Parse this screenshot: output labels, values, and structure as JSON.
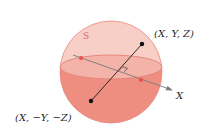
{
  "diagram": {
    "sphere_label": "S",
    "point_upper_label": "(X, Y, Z)",
    "point_lower_label": "(X, −Y, −Z)",
    "axis_label": "X",
    "elements": {
      "sphere": {
        "cx": 111,
        "cy": 72,
        "r": 51
      },
      "equator": {
        "cx": 111,
        "cy": 67,
        "rx": 51,
        "ry": 12
      },
      "point_upper": {
        "x": 142,
        "y": 44
      },
      "point_lower": {
        "x": 91,
        "y": 101
      },
      "axis": {
        "x1": 73,
        "y1": 55,
        "x2": 172,
        "y2": 90
      },
      "axis_intersections": [
        {
          "x": 81,
          "y": 58
        },
        {
          "x": 141,
          "y": 80
        }
      ]
    }
  },
  "colors": {
    "sphere_upper_fill": "#f7cfc6",
    "sphere_lower_fill": "#ee8e80",
    "equator_fill": "#f3b3a8",
    "sphere_outline": "#e88a80",
    "segment_line": "#1a1a1a",
    "axis_line": "#7a7a7a",
    "intersection_dot": "#e8504a",
    "endpoint_dot": "#111111",
    "sphere_label": "#e07070",
    "text": "#2a2a2a"
  }
}
